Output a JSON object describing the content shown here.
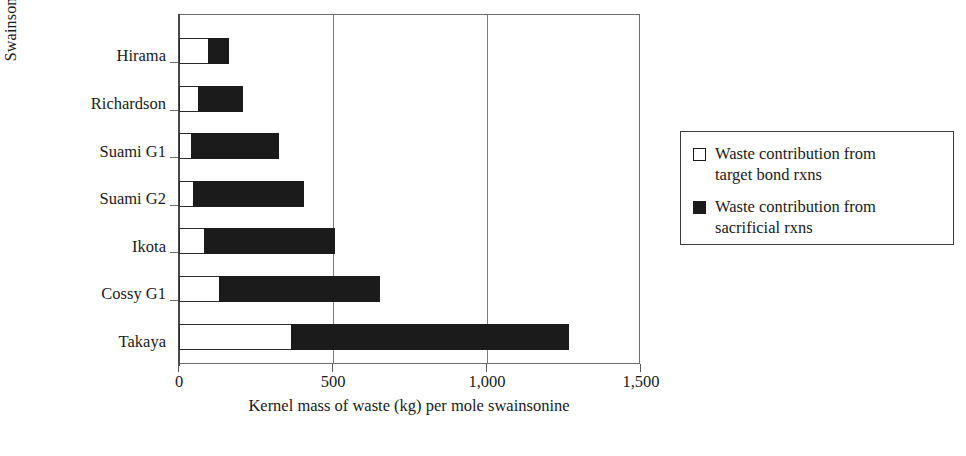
{
  "chart_data": {
    "type": "bar",
    "orientation": "horizontal",
    "stacked": true,
    "title": "",
    "xlabel": "Kernel mass of waste (kg) per mole swainsonine",
    "ylabel": "Swainsonine plan",
    "xlim": [
      0,
      1500
    ],
    "xticks": [
      0,
      500,
      1000,
      1500
    ],
    "xtick_labels": [
      "0",
      "500",
      "1,000",
      "1,500"
    ],
    "grid": "vertical",
    "legend_position": "right",
    "categories": [
      "Hirama",
      "Richardson",
      "Suami G1",
      "Suami G2",
      "Ikota",
      "Cossy G1",
      "Takaya"
    ],
    "series": [
      {
        "name": "Waste contribution from target bond rxns",
        "color": "#ffffff",
        "values": [
          97,
          65,
          42,
          49,
          84,
          133,
          367
        ]
      },
      {
        "name": "Waste contribution from sacrificial rxns",
        "color": "#1b1b1b",
        "values": [
          65,
          143,
          283,
          357,
          422,
          520,
          899
        ]
      }
    ],
    "totals": [
      162,
      208,
      325,
      406,
      506,
      653,
      1266
    ]
  },
  "axes": {
    "y_title": "Swainsonine plan",
    "x_title": "Kernel mass of waste (kg) per mole swainsonine",
    "x_tick_labels": [
      "0",
      "500",
      "1,000",
      "1,500"
    ],
    "y_tick_labels": [
      "Hirama",
      "Richardson",
      "Suami G1",
      "Suami G2",
      "Ikota",
      "Cossy G1",
      "Takaya"
    ]
  },
  "legend": {
    "entries": [
      {
        "swatch": "hollow-square-icon",
        "line1": "Waste contribution from",
        "line2": "target bond rxns"
      },
      {
        "swatch": "filled-square-icon",
        "line1": "Waste contribution from",
        "line2": "sacrificial rxns"
      }
    ]
  },
  "caption": {
    "sliver": ""
  },
  "colors": {
    "target_bond": "#ffffff",
    "sacrificial": "#1b1b1b",
    "axis": "#4a4a4a",
    "grid": "#7d7d7d"
  }
}
